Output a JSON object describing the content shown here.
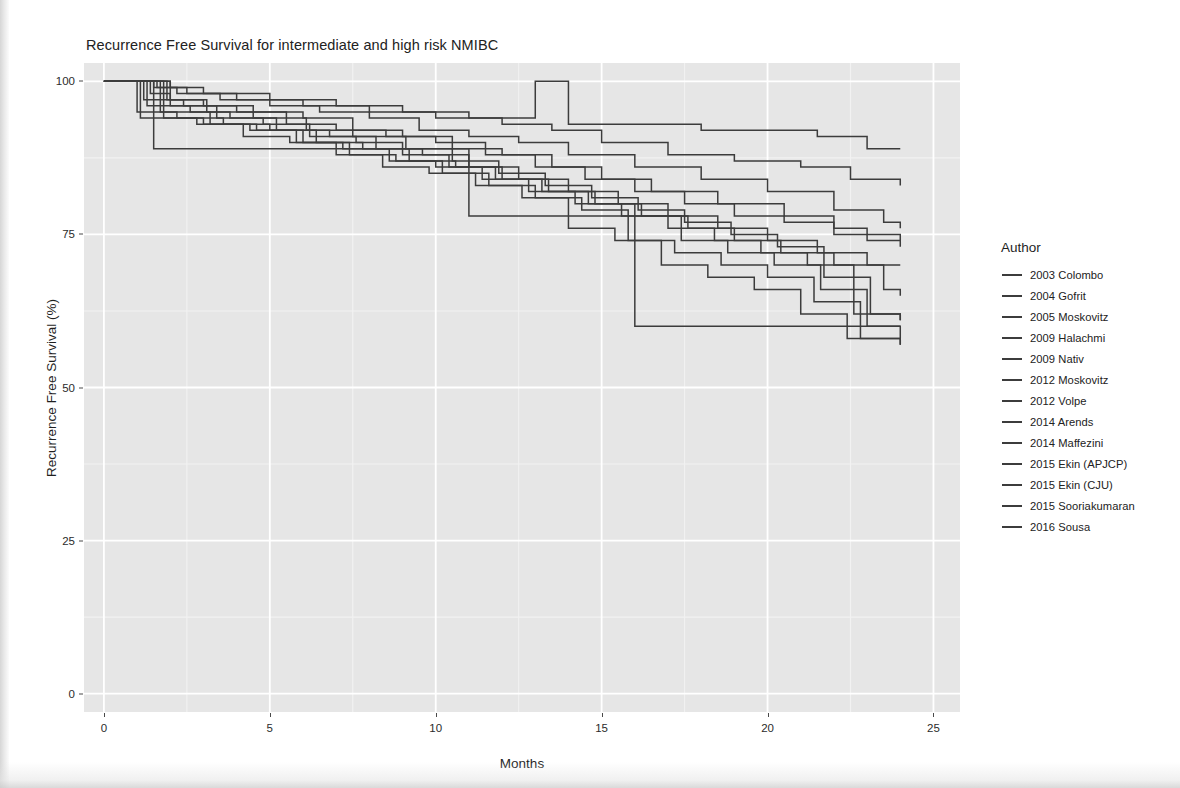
{
  "chart_data": {
    "type": "line",
    "title": "Recurrence Free Survival for intermediate and high risk NMIBC",
    "subtitle": "",
    "xlabel": "Months",
    "ylabel": "Recurrence Free Survival (%)",
    "xlim": [
      -0.6,
      25.8
    ],
    "ylim": [
      -3,
      103
    ],
    "xticks": [
      0,
      5,
      10,
      15,
      20,
      25
    ],
    "xtick_labels": [
      "0",
      "5",
      "10",
      "15",
      "20",
      "25"
    ],
    "yticks": [
      0,
      25,
      50,
      75,
      100
    ],
    "ytick_labels": [
      "0",
      "25",
      "50",
      "75",
      "100"
    ],
    "grid": true,
    "grid_major_color": "#ffffff",
    "grid_minor_color": "#f2f2f2",
    "panel_background": "#e6e6e6",
    "line_color": "#3c3c3c",
    "line_style": "step-post",
    "legend_position": "right",
    "legend_title": "Author",
    "series": [
      {
        "name": "2003 Colombo",
        "x": [
          0,
          1.0,
          2.0,
          3.0,
          5.0,
          7.0,
          9.0,
          11.0,
          13.0,
          14.0,
          16.0,
          18.0,
          20.0,
          21.5,
          23.0,
          24.0
        ],
        "values": [
          100,
          100,
          99,
          98,
          97,
          96,
          95,
          94,
          100,
          93,
          93,
          92,
          92,
          91,
          89,
          89
        ]
      },
      {
        "name": "2004 Gofrit",
        "x": [
          0,
          1.5,
          2.5,
          4.0,
          6.0,
          8.0,
          10.0,
          12.0,
          13.5,
          15.0,
          17.0,
          19.0,
          21.0,
          22.5,
          24.0
        ],
        "values": [
          100,
          99,
          98,
          97,
          96,
          95,
          94,
          93,
          92,
          90,
          88,
          87,
          86,
          84,
          83
        ]
      },
      {
        "name": "2005 Moskovitz",
        "x": [
          0,
          1.6,
          2.2,
          3.5,
          5.0,
          6.5,
          8.0,
          9.5,
          11.0,
          12.5,
          14.0,
          16.0,
          18.0,
          20.0,
          22.0,
          23.5,
          24.0
        ],
        "values": [
          100,
          99,
          98,
          97,
          96,
          95,
          94,
          92,
          91,
          90,
          88,
          86,
          84,
          82,
          79,
          77,
          76
        ]
      },
      {
        "name": "2009 Halachmi",
        "x": [
          0,
          1.4,
          2.0,
          3.0,
          4.5,
          6.0,
          7.5,
          9.0,
          10.5,
          12.0,
          13.5,
          15.0,
          16.5,
          18.5,
          20.5,
          22.0,
          23.0,
          24.0
        ],
        "values": [
          100,
          98,
          97,
          96,
          95,
          94,
          92,
          91,
          89,
          88,
          86,
          84,
          82,
          80,
          78,
          76,
          75,
          74
        ]
      },
      {
        "name": "2009 Nativ",
        "x": [
          0,
          1.2,
          2.4,
          4.0,
          5.5,
          7.0,
          8.5,
          10.0,
          11.5,
          13.0,
          14.5,
          16.0,
          17.5,
          19.0,
          20.5,
          22.0,
          23.0,
          24.0
        ],
        "values": [
          100,
          97,
          96,
          95,
          93,
          92,
          91,
          90,
          88,
          86,
          84,
          82,
          80,
          78,
          77,
          75,
          74,
          73
        ]
      },
      {
        "name": "2012 Moskovitz",
        "x": [
          0,
          1.3,
          2.6,
          3.8,
          5.2,
          6.8,
          8.2,
          9.6,
          11.0,
          12.5,
          14.0,
          15.5,
          17.0,
          18.5,
          20.0,
          21.5,
          23.0,
          24.0
        ],
        "values": [
          100,
          96,
          95,
          94,
          92,
          91,
          89,
          88,
          86,
          84,
          82,
          80,
          78,
          76,
          74,
          72,
          70,
          70
        ]
      },
      {
        "name": "2012 Volpe",
        "x": [
          0,
          1.0,
          2.2,
          3.6,
          5.0,
          6.4,
          7.8,
          9.2,
          10.6,
          12.0,
          13.4,
          14.8,
          16.2,
          17.6,
          19.0,
          20.4,
          22.0,
          23.5,
          24.0
        ],
        "values": [
          100,
          95,
          94,
          93,
          92,
          90,
          89,
          87,
          86,
          84,
          82,
          80,
          78,
          76,
          74,
          72,
          70,
          66,
          65
        ]
      },
      {
        "name": "2014 Arends",
        "x": [
          0,
          1.8,
          3.0,
          4.4,
          5.8,
          7.2,
          8.6,
          10.0,
          11.4,
          12.8,
          14.2,
          15.6,
          17.0,
          18.4,
          19.8,
          21.2,
          22.6,
          24.0
        ],
        "values": [
          100,
          94,
          93,
          92,
          90,
          89,
          87,
          86,
          84,
          82,
          80,
          78,
          76,
          74,
          72,
          70,
          62,
          61
        ]
      },
      {
        "name": "2014 Maffezini",
        "x": [
          0,
          1.5,
          8.0,
          11.0,
          13.5,
          15.5,
          16.0,
          18.0,
          20.0,
          22.0,
          24.0
        ],
        "values": [
          100,
          89,
          89,
          78,
          78,
          78,
          60,
          60,
          60,
          60,
          60
        ]
      },
      {
        "name": "2015 Ekin (APJCP)",
        "x": [
          0,
          2.0,
          3.4,
          4.8,
          6.2,
          7.6,
          9.0,
          10.4,
          11.8,
          13.2,
          14.6,
          16.0,
          17.4,
          18.8,
          20.2,
          21.6,
          23.0,
          24.0
        ],
        "values": [
          100,
          96,
          94,
          93,
          91,
          90,
          88,
          86,
          84,
          82,
          80,
          78,
          74,
          72,
          70,
          66,
          60,
          58
        ]
      },
      {
        "name": "2015 Ekin (CJU)",
        "x": [
          0,
          1.7,
          3.2,
          4.6,
          6.0,
          7.4,
          8.8,
          10.2,
          11.6,
          13.0,
          14.4,
          15.8,
          17.2,
          18.6,
          20.0,
          21.4,
          22.8,
          24.0
        ],
        "values": [
          100,
          95,
          93,
          92,
          90,
          88,
          87,
          85,
          83,
          81,
          79,
          74,
          72,
          70,
          68,
          64,
          58,
          57
        ]
      },
      {
        "name": "2015 Sooriakumaran",
        "x": [
          0,
          1.1,
          2.8,
          4.2,
          5.6,
          7.0,
          8.4,
          9.8,
          11.2,
          12.6,
          14.0,
          15.4,
          16.8,
          18.2,
          19.6,
          21.0,
          22.4,
          24.0
        ],
        "values": [
          100,
          94,
          93,
          91,
          90,
          88,
          86,
          85,
          83,
          81,
          76,
          74,
          70,
          68,
          66,
          62,
          58,
          57
        ]
      },
      {
        "name": "2016 Sousa",
        "x": [
          0,
          1.9,
          3.1,
          4.5,
          6.1,
          7.5,
          9.1,
          10.5,
          11.9,
          13.3,
          14.7,
          16.1,
          17.5,
          18.9,
          20.3,
          21.7,
          23.1,
          24.0
        ],
        "values": [
          100,
          97,
          95,
          94,
          92,
          91,
          89,
          87,
          85,
          83,
          81,
          79,
          77,
          75,
          73,
          68,
          62,
          61
        ]
      }
    ]
  }
}
